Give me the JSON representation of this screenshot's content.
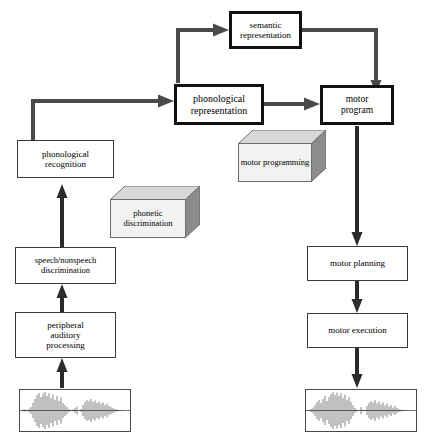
{
  "diagram": {
    "nodes": {
      "semantic_representation": "semantic\nrepresentation",
      "semantic_representation_line1": "semantic",
      "semantic_representation_line2": "representation",
      "phonological_representation_line1": "phonological",
      "phonological_representation_line2": "representation",
      "motor_program_line1": "motor",
      "motor_program_line2": "program",
      "phonological_recognition_line1": "phonological",
      "phonological_recognition_line2": "recognition",
      "speech_nonspeech_line1": "speech/nonspeech",
      "speech_nonspeech_line2": "discrimination",
      "peripheral_line1": "peripheral",
      "peripheral_line2": "auditory",
      "peripheral_line3": "processing",
      "motor_planning": "motor planning",
      "motor_execution": "motor execution"
    },
    "blocks": {
      "phonetic_discrimination_line1": "phonetic",
      "phonetic_discrimination_line2": "discrimination",
      "motor_programming_line1": "motor",
      "motor_programming_line2": "programming"
    },
    "waveforms": {
      "input_label": "input speech waveform",
      "output_label": "output speech waveform"
    },
    "colors": {
      "thin_border": "#3a3a3a",
      "thick_border": "#111111",
      "arrow": "#4a4a4a",
      "block_face": "#f2f2f2",
      "block_side": "#8c8c8c",
      "block_top": "#d8d8d8",
      "background": "#ffffff"
    }
  }
}
